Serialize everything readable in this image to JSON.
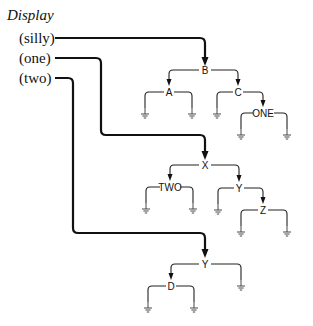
{
  "title": "Display",
  "arguments": [
    "(silly)",
    "(one)",
    "(two)"
  ],
  "trees": [
    {
      "argument": "silly",
      "root": {
        "label": "B",
        "x": 205,
        "y": 70
      },
      "nodes": [
        {
          "label": "A",
          "x": 169,
          "y": 92
        },
        {
          "label": "C",
          "x": 238,
          "y": 92
        },
        {
          "label": "ONE",
          "x": 263,
          "y": 113
        }
      ]
    },
    {
      "argument": "one",
      "root": {
        "label": "X",
        "x": 205,
        "y": 165
      },
      "nodes": [
        {
          "label": "TWO",
          "x": 170,
          "y": 187
        },
        {
          "label": "Y",
          "x": 239,
          "y": 188
        },
        {
          "label": "Z",
          "x": 263,
          "y": 210
        }
      ]
    },
    {
      "argument": "two",
      "root": {
        "label": "Y",
        "x": 205,
        "y": 264
      },
      "nodes": [
        {
          "label": "D",
          "x": 171,
          "y": 286
        }
      ]
    }
  ],
  "labels": {
    "b": "B",
    "a": "A",
    "c": "C",
    "one": "ONE",
    "x": "X",
    "two": "TWO",
    "y1": "Y",
    "z": "Z",
    "y2": "Y",
    "d": "D"
  }
}
